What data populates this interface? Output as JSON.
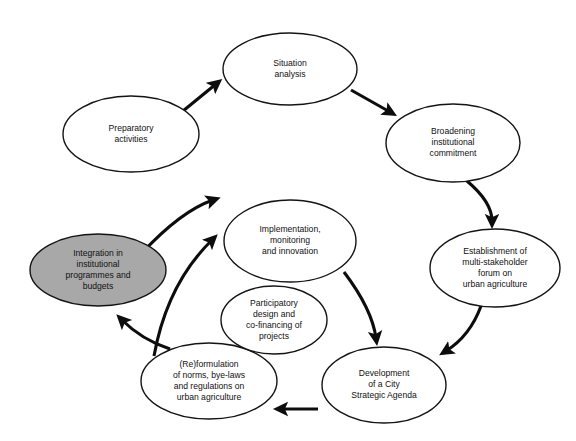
{
  "diagram": {
    "type": "cycle-flow-diagram",
    "background_color": "#ffffff",
    "node_fill": "#ffffff",
    "node_highlight_fill": "#a8a8a8",
    "stroke_color": "#141414",
    "nodes": [
      {
        "id": "preparatory-activities",
        "lines": [
          "Preparatory",
          "activities"
        ],
        "cx": 131,
        "cy": 134,
        "rx": 68,
        "ry": 38,
        "highlighted": false
      },
      {
        "id": "situation-analysis",
        "lines": [
          "Situation",
          "analysis"
        ],
        "cx": 290,
        "cy": 69,
        "rx": 67,
        "ry": 36,
        "highlighted": false
      },
      {
        "id": "broadening-institutional-commitment",
        "lines": [
          "Broadening",
          "institutional",
          "commitment"
        ],
        "cx": 453,
        "cy": 143,
        "rx": 67,
        "ry": 39,
        "highlighted": false
      },
      {
        "id": "establishment-multi-stakeholder-forum",
        "lines": [
          "Establishment of",
          "multi-stakeholder",
          "forum on",
          "urban agriculture"
        ],
        "cx": 495,
        "cy": 268,
        "rx": 65,
        "ry": 39,
        "highlighted": false
      },
      {
        "id": "development-city-strategic-agenda",
        "lines": [
          "Development",
          "of a City",
          "Strategic Agenda"
        ],
        "cx": 384,
        "cy": 385,
        "rx": 62,
        "ry": 38,
        "highlighted": false
      },
      {
        "id": "reformulation-norms-byelaws",
        "lines": [
          "(Re)formulation",
          "of norms, bye-laws",
          "and regulations on",
          "urban agriculture"
        ],
        "cx": 209,
        "cy": 381,
        "rx": 68,
        "ry": 38,
        "highlighted": false
      },
      {
        "id": "participatory-design-cofinancing",
        "lines": [
          "Participatory",
          "design and",
          "co-financing of",
          "projects"
        ],
        "cx": 274,
        "cy": 320,
        "rx": 53,
        "ry": 34,
        "highlighted": false
      },
      {
        "id": "implementation-monitoring-innovation",
        "lines": [
          "Implementation,",
          "monitoring",
          "and innovation"
        ],
        "cx": 290,
        "cy": 241,
        "rx": 66,
        "ry": 41,
        "highlighted": false
      },
      {
        "id": "integration-institutional-programmes-budgets",
        "lines": [
          "Integration in",
          "institutional",
          "programmes and",
          "budgets"
        ],
        "cx": 98,
        "cy": 270,
        "rx": 68,
        "ry": 36,
        "highlighted": true
      }
    ],
    "arrows": [
      {
        "id": "preparatory-to-situation",
        "from": "preparatory-activities",
        "to": "situation-analysis",
        "shape": "straight"
      },
      {
        "id": "situation-to-broadening",
        "from": "situation-analysis",
        "to": "broadening-institutional-commitment",
        "shape": "straight"
      },
      {
        "id": "broadening-to-establishment",
        "from": "broadening-institutional-commitment",
        "to": "establishment-multi-stakeholder-forum",
        "shape": "curved"
      },
      {
        "id": "establishment-to-development",
        "from": "establishment-multi-stakeholder-forum",
        "to": "development-city-strategic-agenda",
        "shape": "curved"
      },
      {
        "id": "development-to-reformulation",
        "from": "development-city-strategic-agenda",
        "to": "reformulation-norms-byelaws",
        "shape": "straight"
      },
      {
        "id": "reformulation-to-integration",
        "from": "reformulation-norms-byelaws",
        "to": "integration-institutional-programmes-budgets",
        "shape": "curved"
      },
      {
        "id": "integration-to-implementation",
        "from": "integration-institutional-programmes-budgets",
        "to": "implementation-monitoring-innovation",
        "shape": "curved"
      },
      {
        "id": "reformulation-to-implementation",
        "from": "reformulation-norms-byelaws",
        "to": "implementation-monitoring-innovation",
        "shape": "curved"
      },
      {
        "id": "implementation-to-development",
        "from": "implementation-monitoring-innovation",
        "to": "development-city-strategic-agenda",
        "shape": "curved"
      }
    ]
  }
}
